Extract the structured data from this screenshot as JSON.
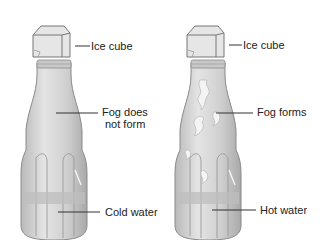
{
  "diagram": {
    "left_bottle": {
      "labels": {
        "ice_cube": "Ice cube",
        "fog_line1": "Fog does",
        "fog_line2": "not form",
        "water": "Cold water"
      }
    },
    "right_bottle": {
      "labels": {
        "ice_cube": "Ice cube",
        "fog": "Fog forms",
        "water": "Hot water"
      }
    },
    "colors": {
      "bottle_fill": "#d4d4d4",
      "bottle_stroke": "#8a8a8a",
      "ice_fill": "#e6e6e6",
      "water_fill": "#bdbdbd",
      "fog_fill": "#f2f2f2"
    }
  }
}
